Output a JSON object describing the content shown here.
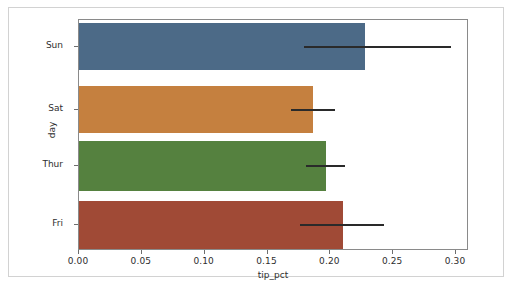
{
  "figure": {
    "width": 512,
    "height": 292,
    "background": "#ffffff",
    "border_color": "#d2d2d2",
    "axes_spine_color": "#8a8a8a"
  },
  "axes_box": {
    "left": 78,
    "top": 19,
    "width": 390,
    "height": 231
  },
  "scale": {
    "x_min_value": 0.0,
    "x_max_value": 0.31,
    "x_pixel_at_zero": 78,
    "pixels_per_unit": 1256.7
  },
  "chart_data": {
    "type": "bar",
    "orientation": "horizontal",
    "title": "",
    "xlabel": "tip_pct",
    "ylabel": "day",
    "categories": [
      "Sun",
      "Sat",
      "Thur",
      "Fri"
    ],
    "values": [
      0.2276,
      0.186,
      0.1965,
      0.21
    ],
    "errors_low": [
      0.179,
      0.169,
      0.181,
      0.176
    ],
    "errors_high": [
      0.296,
      0.204,
      0.212,
      0.243
    ],
    "colors": [
      "#4c6a87",
      "#c5803f",
      "#55813f",
      "#a04a36"
    ],
    "xlim": [
      0.0,
      0.31
    ],
    "xticks": [
      0.0,
      0.05,
      0.1,
      0.15,
      0.2,
      0.25,
      0.3
    ],
    "xticklabels": [
      "0.00",
      "0.05",
      "0.10",
      "0.15",
      "0.20",
      "0.25",
      "0.30"
    ],
    "grid": false,
    "legend": null,
    "errorbar_color": "#2a2a2a",
    "bars": [
      {
        "category": "Sun",
        "value": 0.2276,
        "color": "#4c6a87",
        "err_low": 0.179,
        "err_high": 0.296,
        "top": 3,
        "height": 47,
        "center": 27
      },
      {
        "category": "Sat",
        "value": 0.186,
        "color": "#c5803f",
        "err_low": 0.169,
        "err_high": 0.204,
        "top": 66,
        "height": 47,
        "center": 90
      },
      {
        "category": "Thur",
        "value": 0.1965,
        "color": "#55813f",
        "err_low": 0.181,
        "err_high": 0.212,
        "top": 121,
        "height": 50,
        "center": 146
      },
      {
        "category": "Fri",
        "value": 0.21,
        "color": "#a04a36",
        "err_low": 0.176,
        "err_high": 0.243,
        "top": 181,
        "height": 48,
        "center": 205
      }
    ]
  }
}
